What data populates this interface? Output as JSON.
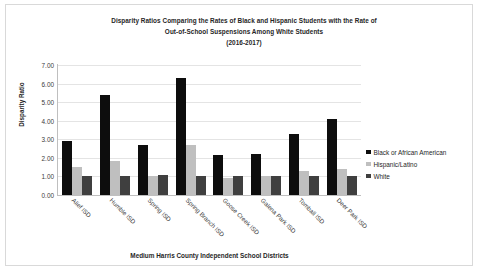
{
  "chart_data": {
    "type": "bar",
    "title": "Disparity Ratios Comparing the Rates of Black and Hispanic Students with the Rate of Out-of-School Suspensions Among White Students (2016-2017)",
    "title_lines": [
      "Disparity Ratios Comparing the Rates of Black and Hispanic Students with the Rate of",
      "Out-of-School Suspensions Among White Students",
      "(2016-2017)"
    ],
    "xlabel": "Medium Harris County Independent School Districts",
    "ylabel": "Disparity Ratio",
    "ylim": [
      0,
      7
    ],
    "ytick_labels": [
      "7.00",
      "6.00",
      "5.00",
      "4.00",
      "3.00",
      "2.00",
      "1.00",
      "0.00"
    ],
    "ytick_values": [
      7,
      6,
      5,
      4,
      3,
      2,
      1,
      0
    ],
    "grid": true,
    "legend_position": "right",
    "categories": [
      "Alief ISD",
      "Humble ISD",
      "Spring ISD",
      "Spring Branch ISD",
      "Goose Creek ISD",
      "Galena Park ISD",
      "Tomball ISD",
      "Deer Park ISD"
    ],
    "series": [
      {
        "name": "Black or African American",
        "color": "#0d0d0d",
        "values": [
          2.9,
          5.4,
          2.7,
          6.3,
          2.15,
          2.2,
          3.3,
          4.1
        ]
      },
      {
        "name": "Hispanic/Latino",
        "color": "#bfbfbf",
        "values": [
          1.5,
          1.85,
          1.0,
          2.7,
          0.9,
          1.05,
          1.3,
          1.4
        ]
      },
      {
        "name": "White",
        "color": "#3f3f3f",
        "values": [
          1.0,
          1.0,
          1.1,
          1.0,
          1.0,
          1.0,
          1.0,
          1.0
        ]
      }
    ]
  }
}
